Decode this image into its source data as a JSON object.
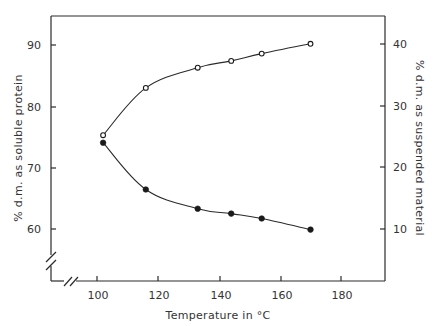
{
  "chart_data": {
    "type": "line",
    "title": "",
    "xlabel": "Temperature in °C",
    "ylabel": "% d.m. as soluble protein",
    "y2label": "% d.m. as suspended material",
    "xlim": [
      85,
      190
    ],
    "ylim": [
      51.7,
      95.2
    ],
    "y2lim": [
      1.7,
      45.2
    ],
    "x_ticks": [
      100,
      120,
      140,
      160,
      180
    ],
    "y_ticks": [
      60,
      70,
      80,
      90
    ],
    "y2_ticks": [
      10,
      20,
      30,
      40
    ],
    "grid": false,
    "legend": "none",
    "axis_breaks": [
      "x",
      "y"
    ],
    "series": [
      {
        "name": "soluble protein",
        "axis": "left",
        "marker": "open-circle",
        "x": [
          102,
          116,
          133,
          144,
          154,
          170
        ],
        "y": [
          75.3,
          83.0,
          86.3,
          87.4,
          88.6,
          90.2
        ]
      },
      {
        "name": "suspended material",
        "axis": "right",
        "marker": "filled-circle",
        "x": [
          102,
          116,
          133,
          144,
          154,
          170
        ],
        "y": [
          24.0,
          16.4,
          13.3,
          12.5,
          11.7,
          9.9
        ]
      }
    ]
  },
  "labels": {
    "xlabel": "Temperature in °C",
    "ylabel": "% d.m. as soluble protein",
    "y2label": "% d.m. as suspended material",
    "x_ticks": [
      "100",
      "120",
      "140",
      "160",
      "180"
    ],
    "y_ticks": [
      "90",
      "80",
      "70",
      "60"
    ],
    "y2_ticks": [
      "40",
      "30",
      "20",
      "10"
    ]
  }
}
